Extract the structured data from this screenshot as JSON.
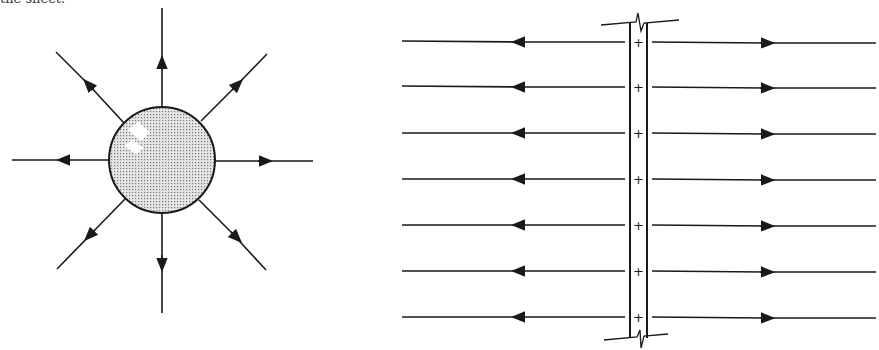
{
  "top_fragment": "the sheet.",
  "figures": {
    "point_charge": {
      "description": "Positively charged sphere with electric field lines radiating outward",
      "field_line_count": 8,
      "field_direction": "outward"
    },
    "charged_sheet": {
      "description": "Infinite plane sheet of positive charge seen edge-on with uniform field lines pointing away on both sides",
      "charge_symbol": "+",
      "charge_marks": 7,
      "field_line_rows": 7,
      "field_direction": "away from sheet"
    }
  },
  "colors": {
    "stroke": "#1a1a1a",
    "sphere_fill": "#cfcfcf",
    "background": "#ffffff"
  }
}
